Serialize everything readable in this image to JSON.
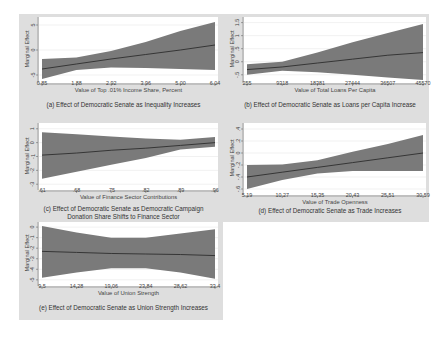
{
  "colors": {
    "band": "#7a7a7a",
    "line": "#2e2e2e",
    "plot_bg": "#ffffff",
    "outer_bg": "#dedede",
    "grid": "#e8e8e8"
  },
  "chart_data": [
    {
      "id": "a",
      "type": "area",
      "title": "(a) Effect of Democratic Senate as Inequality Increases",
      "xlabel": "Value of Top .01% Income Share, Percent",
      "ylabel": "Marginal Effect",
      "x_ticks": [
        "0.85",
        "1.88",
        "2.92",
        "3.96",
        "5.00",
        "6.04"
      ],
      "y_ticks": [
        "-5",
        "0",
        "5"
      ],
      "xlim": [
        0.85,
        6.04
      ],
      "ylim": [
        -6,
        6
      ],
      "x": [
        0.85,
        1.88,
        2.92,
        3.96,
        5.0,
        6.04
      ],
      "series": [
        {
          "name": "estimate",
          "values": [
            -3.8,
            -2.8,
            -1.8,
            -0.9,
            0.0,
            1.0
          ]
        },
        {
          "name": "lower",
          "values": [
            -5.8,
            -4.0,
            -3.5,
            -3.6,
            -3.8,
            -4.0
          ]
        },
        {
          "name": "upper",
          "values": [
            -1.8,
            -1.5,
            -0.2,
            1.6,
            3.8,
            5.6
          ]
        }
      ],
      "grid": true
    },
    {
      "id": "b",
      "type": "area",
      "title": "(b) Effect of Democratic Senate as Loans per Capita Increase",
      "xlabel": "Value of Total Loans Per Capita",
      "ylabel": "Marginal Effect",
      "x_ticks": [
        "255",
        "9318",
        "18381",
        "27444",
        "36507",
        "45570"
      ],
      "y_ticks": [
        "-.5",
        "0",
        ".5",
        "1",
        "1.5"
      ],
      "xlim": [
        255,
        45570
      ],
      "ylim": [
        -0.7,
        1.6
      ],
      "x": [
        255,
        9318,
        18381,
        27444,
        36507,
        45570
      ],
      "series": [
        {
          "name": "estimate",
          "values": [
            -0.3,
            -0.2,
            -0.05,
            0.1,
            0.25,
            0.35
          ]
        },
        {
          "name": "lower",
          "values": [
            -0.5,
            -0.35,
            -0.4,
            -0.5,
            -0.6,
            -0.7
          ]
        },
        {
          "name": "upper",
          "values": [
            -0.1,
            0.0,
            0.35,
            0.75,
            1.1,
            1.45
          ]
        }
      ],
      "grid": true
    },
    {
      "id": "c",
      "type": "area",
      "title": "(c) Effect of Democratic Senate as Democratic Campaign Donation Share Shifts to Finance Sector",
      "title_lines": [
        "(c) Effect of Democratic Senate as Democratic Campaign",
        "Donation Share Shifts to Finance Sector"
      ],
      "xlabel": "Value of Finance Sector Contributions",
      "ylabel": "Marginal Effect",
      "x_ticks": [
        ".61",
        ".68",
        ".75",
        ".82",
        ".89",
        ".96"
      ],
      "y_ticks": [
        "-3",
        "-2",
        "-1",
        "0",
        "1"
      ],
      "xlim": [
        0.61,
        0.96
      ],
      "ylim": [
        -3.2,
        1.2
      ],
      "x": [
        0.61,
        0.68,
        0.75,
        0.82,
        0.89,
        0.96
      ],
      "series": [
        {
          "name": "estimate",
          "values": [
            -0.9,
            -0.75,
            -0.55,
            -0.4,
            -0.2,
            0.0
          ]
        },
        {
          "name": "lower",
          "values": [
            -2.6,
            -2.1,
            -1.6,
            -1.1,
            -0.5,
            -0.3
          ]
        },
        {
          "name": "upper",
          "values": [
            0.75,
            0.6,
            0.45,
            0.3,
            0.2,
            0.4
          ]
        }
      ],
      "grid": true
    },
    {
      "id": "d",
      "type": "area",
      "title": "(d) Effect of Democratic Senate as Trade Increases",
      "xlabel": "Value of Trade Openness",
      "ylabel": "Marginal Effect",
      "x_ticks": [
        "5.19",
        "10.27",
        "15.35",
        "20.43",
        "25.51",
        "30.59"
      ],
      "y_ticks": [
        "-.6",
        "-.4",
        "-.2",
        "0",
        ".2",
        ".4"
      ],
      "xlim": [
        5.19,
        30.59
      ],
      "ylim": [
        -0.65,
        0.45
      ],
      "x": [
        5.19,
        10.27,
        15.35,
        20.43,
        25.51,
        30.59
      ],
      "series": [
        {
          "name": "estimate",
          "values": [
            -0.4,
            -0.32,
            -0.24,
            -0.16,
            -0.08,
            0.0
          ]
        },
        {
          "name": "lower",
          "values": [
            -0.6,
            -0.45,
            -0.34,
            -0.3,
            -0.3,
            -0.3
          ]
        },
        {
          "name": "upper",
          "values": [
            -0.2,
            -0.19,
            -0.12,
            0.02,
            0.15,
            0.3
          ]
        }
      ],
      "grid": true
    },
    {
      "id": "e",
      "type": "area",
      "title": "(e) Effect of Democratic Senate as Union Strength Increases",
      "xlabel": "Value of Union Strength",
      "ylabel": "Marginal Effect",
      "x_ticks": [
        "9.5",
        "14.28",
        "19.06",
        "23.84",
        "28.62",
        "33.4"
      ],
      "y_ticks": [
        "-5",
        "-4",
        "-3",
        "-2",
        "-1",
        "0"
      ],
      "xlim": [
        9.5,
        33.4
      ],
      "ylim": [
        -5.3,
        0.2
      ],
      "x": [
        9.5,
        14.28,
        19.06,
        23.84,
        28.62,
        33.4
      ],
      "series": [
        {
          "name": "estimate",
          "values": [
            -2.3,
            -2.4,
            -2.5,
            -2.55,
            -2.6,
            -2.7
          ]
        },
        {
          "name": "lower",
          "values": [
            -4.8,
            -4.3,
            -3.9,
            -3.9,
            -4.3,
            -4.9
          ]
        },
        {
          "name": "upper",
          "values": [
            0.1,
            -0.5,
            -1.0,
            -1.0,
            -0.6,
            -0.2
          ]
        }
      ],
      "grid": true
    }
  ]
}
